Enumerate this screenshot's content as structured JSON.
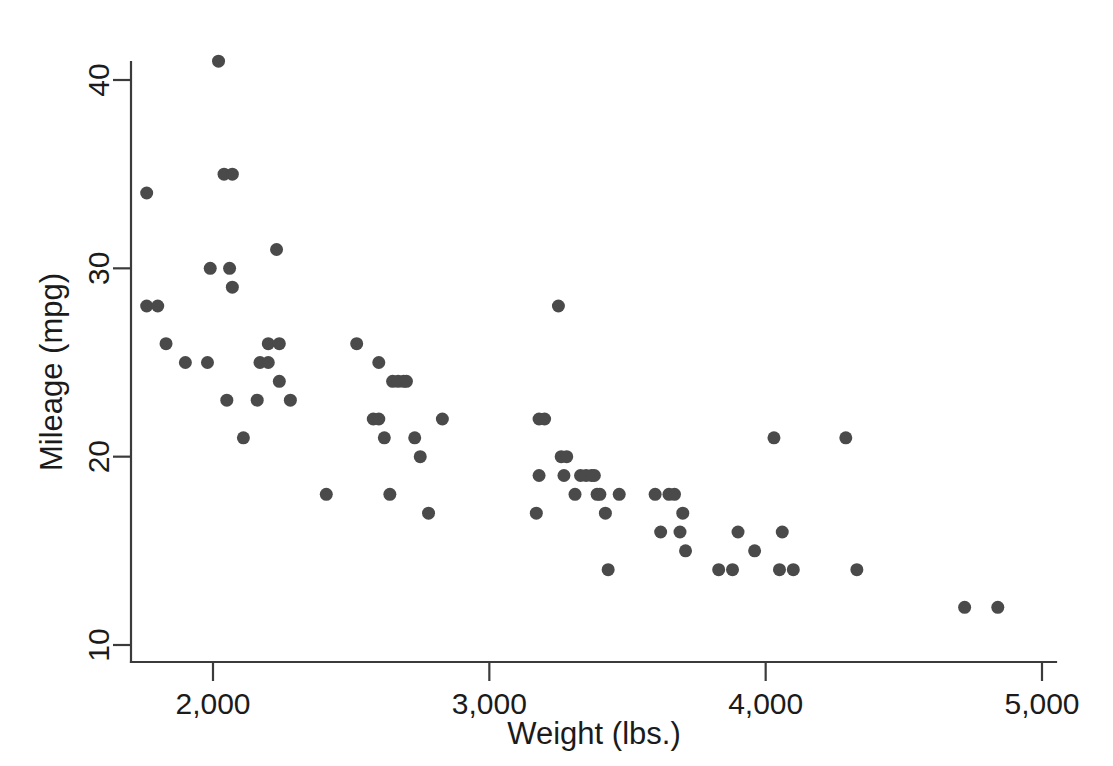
{
  "chart_data": {
    "type": "scatter",
    "title": "",
    "subtitle": "",
    "xlabel": "Weight (lbs.)",
    "ylabel": "Mileage (mpg)",
    "xlim": [
      1690,
      4880
    ],
    "ylim": [
      9.3,
      42.0
    ],
    "xticks": [
      2000,
      3000,
      4000,
      5000
    ],
    "xticklabels": [
      "2,000",
      "3,000",
      "4,000",
      "5,000"
    ],
    "yticks": [
      10,
      20,
      30,
      40
    ],
    "yticklabels": [
      "10",
      "20",
      "30",
      "40"
    ],
    "grid": false,
    "legend": null,
    "marker": {
      "shape": "circle",
      "color": "#4a4a4a",
      "size_px": 13
    },
    "n_points": 74,
    "series": [
      {
        "name": "Automobiles",
        "points": [
          [
            1760,
            28
          ],
          [
            1800,
            28
          ],
          [
            1760,
            34
          ],
          [
            1830,
            26
          ],
          [
            1900,
            25
          ],
          [
            1980,
            25
          ],
          [
            1990,
            30
          ],
          [
            2020,
            41
          ],
          [
            2040,
            35
          ],
          [
            2070,
            35
          ],
          [
            2050,
            23
          ],
          [
            2070,
            29
          ],
          [
            2060,
            30
          ],
          [
            2110,
            21
          ],
          [
            2160,
            23
          ],
          [
            2170,
            25
          ],
          [
            2200,
            25
          ],
          [
            2200,
            26
          ],
          [
            2230,
            31
          ],
          [
            2240,
            24
          ],
          [
            2280,
            23
          ],
          [
            2410,
            18
          ],
          [
            2520,
            26
          ],
          [
            2580,
            22
          ],
          [
            2600,
            22
          ],
          [
            2600,
            25
          ],
          [
            2620,
            21
          ],
          [
            2640,
            18
          ],
          [
            2650,
            24
          ],
          [
            2670,
            24
          ],
          [
            2690,
            24
          ],
          [
            2700,
            24
          ],
          [
            2730,
            21
          ],
          [
            2750,
            20
          ],
          [
            2780,
            17
          ],
          [
            2830,
            22
          ],
          [
            3170,
            17
          ],
          [
            3180,
            19
          ],
          [
            3180,
            22
          ],
          [
            3200,
            22
          ],
          [
            3250,
            28
          ],
          [
            3260,
            20
          ],
          [
            3280,
            20
          ],
          [
            3270,
            19
          ],
          [
            3310,
            18
          ],
          [
            3330,
            19
          ],
          [
            3350,
            19
          ],
          [
            3370,
            19
          ],
          [
            3380,
            19
          ],
          [
            3390,
            18
          ],
          [
            3400,
            18
          ],
          [
            3420,
            17
          ],
          [
            3430,
            14
          ],
          [
            3470,
            18
          ],
          [
            3600,
            18
          ],
          [
            3620,
            16
          ],
          [
            3650,
            18
          ],
          [
            3670,
            18
          ],
          [
            3690,
            16
          ],
          [
            3700,
            17
          ],
          [
            3710,
            15
          ],
          [
            3830,
            14
          ],
          [
            3880,
            14
          ],
          [
            3900,
            16
          ],
          [
            3960,
            15
          ],
          [
            4030,
            21
          ],
          [
            4050,
            14
          ],
          [
            4060,
            16
          ],
          [
            4100,
            14
          ],
          [
            4290,
            21
          ],
          [
            4330,
            14
          ],
          [
            4720,
            12
          ],
          [
            4840,
            12
          ],
          [
            2240,
            26
          ]
        ]
      }
    ]
  },
  "axes": {
    "x_axis_name": "weight-axis",
    "y_axis_name": "mileage-axis"
  }
}
